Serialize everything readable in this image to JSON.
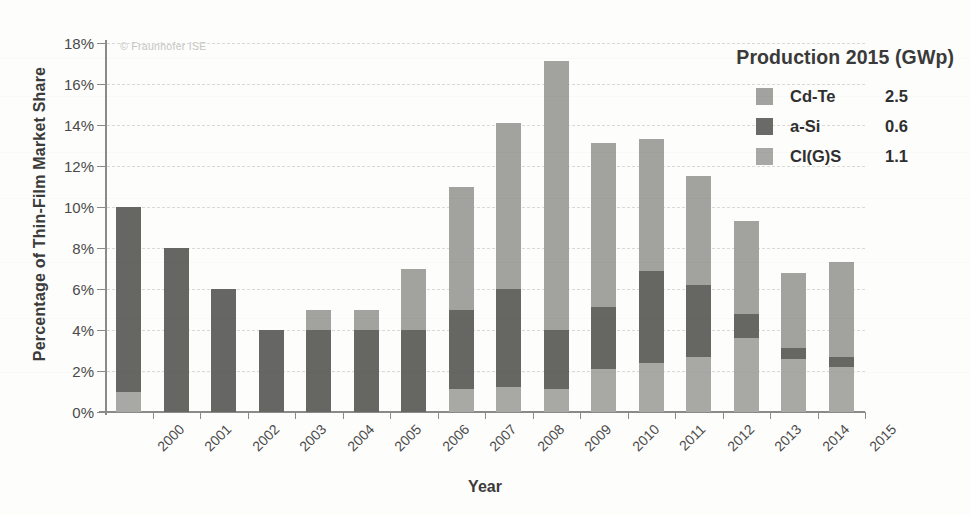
{
  "figure": {
    "watermark": "© Fraunhofer ISE",
    "y_axis_title": "Percentage of Thin-Film Market Share",
    "x_axis_title": "Year"
  },
  "legend": {
    "title": "Production 2015 (GWp)",
    "entries": [
      {
        "icon": "legend-swatch-cdte",
        "name": "Cd-Te",
        "value": "2.5",
        "color": "#a2a29e"
      },
      {
        "icon": "legend-swatch-asi",
        "name": "a-Si",
        "value": "0.6",
        "color": "#6a6a67"
      },
      {
        "icon": "legend-swatch-cigs",
        "name": "CI(G)S",
        "value": "1.1",
        "color": "#a8a8a4"
      }
    ]
  },
  "chart_data": {
    "type": "bar",
    "stacked": true,
    "title": "",
    "xlabel": "Year",
    "ylabel": "Percentage of Thin-Film Market Share",
    "ylim": [
      0,
      18
    ],
    "ytick_labels": [
      "0%",
      "2%",
      "4%",
      "6%",
      "8%",
      "10%",
      "12%",
      "14%",
      "16%",
      "18%"
    ],
    "ytick_values": [
      0,
      2,
      4,
      6,
      8,
      10,
      12,
      14,
      16,
      18
    ],
    "grid": true,
    "legend_position": "top-right",
    "categories": [
      "2000",
      "2001",
      "2002",
      "2003",
      "2004",
      "2005",
      "2006",
      "2007",
      "2008",
      "2009",
      "2010",
      "2011",
      "2012",
      "2013",
      "2014",
      "2015"
    ],
    "stack_order": [
      "CI(G)S",
      "a-Si",
      "Cd-Te"
    ],
    "series": [
      {
        "name": "CI(G)S",
        "color": "#a8a8a4",
        "values": [
          1.0,
          0.0,
          0.0,
          0.0,
          0.0,
          0.0,
          0.0,
          1.1,
          1.2,
          1.1,
          2.1,
          2.4,
          2.7,
          3.6,
          2.6,
          2.2
        ]
      },
      {
        "name": "a-Si",
        "color": "#666663",
        "values": [
          9.0,
          8.0,
          6.0,
          4.0,
          4.0,
          4.0,
          4.0,
          3.9,
          4.8,
          2.9,
          3.0,
          4.5,
          3.5,
          1.2,
          0.5,
          0.5
        ]
      },
      {
        "name": "Cd-Te",
        "color": "#a2a29e",
        "values": [
          0.0,
          0.0,
          0.0,
          0.0,
          1.0,
          1.0,
          3.0,
          6.0,
          8.1,
          13.1,
          8.0,
          6.4,
          5.3,
          4.5,
          3.7,
          4.6
        ]
      }
    ],
    "totals": [
      10.0,
      8.0,
      6.0,
      4.0,
      5.0,
      5.0,
      7.0,
      11.0,
      14.1,
      17.1,
      13.1,
      13.3,
      11.5,
      9.3,
      6.8,
      7.3
    ]
  }
}
